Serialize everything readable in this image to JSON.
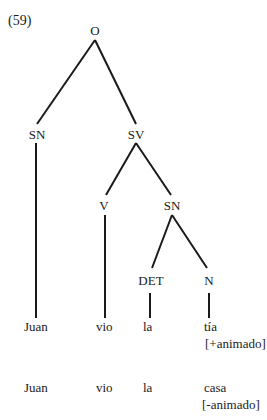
{
  "example": {
    "number": "(59)",
    "cutoff_top_text": ""
  },
  "tree": {
    "root": "O",
    "nodes": {
      "O": "O",
      "SN_subject": "SN",
      "SV": "SV",
      "V": "V",
      "SN_object": "SN",
      "DET": "DET",
      "N": "N"
    },
    "edges": [
      [
        "O",
        "SN_subject"
      ],
      [
        "O",
        "SV"
      ],
      [
        "SV",
        "V"
      ],
      [
        "SV",
        "SN_object"
      ],
      [
        "SN_object",
        "DET"
      ],
      [
        "SN_object",
        "N"
      ],
      [
        "SN_subject",
        "Juan"
      ],
      [
        "V",
        "vio"
      ],
      [
        "DET",
        "la"
      ],
      [
        "N",
        "tía"
      ]
    ]
  },
  "sentence_1": {
    "words": [
      "Juan",
      "vio",
      "la",
      "tía"
    ],
    "feature": "[+animado]"
  },
  "sentence_2": {
    "words": [
      "Juan",
      "vio",
      "la",
      "casa"
    ],
    "feature": "[-animado]"
  }
}
